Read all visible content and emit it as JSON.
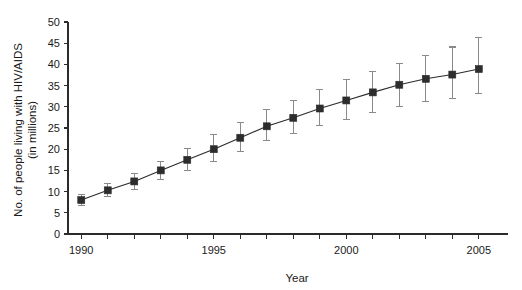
{
  "chart_data": {
    "type": "line",
    "title": "",
    "xlabel": "Year",
    "ylabel_line1": "No. of people living with HIV/AIDS",
    "ylabel_line2": "(in millions)",
    "ylabel": "No. of people living with HIV/AIDS (in millions)",
    "x": [
      1990,
      1991,
      1992,
      1993,
      1994,
      1995,
      1996,
      1997,
      1998,
      1999,
      2000,
      2001,
      2002,
      2003,
      2004,
      2005
    ],
    "values": [
      8.0,
      10.3,
      12.4,
      15.0,
      17.5,
      20.0,
      22.7,
      25.4,
      27.4,
      29.6,
      31.5,
      33.4,
      35.2,
      36.6,
      37.6,
      38.9
    ],
    "error_low": [
      6.8,
      8.8,
      10.6,
      12.9,
      15.0,
      17.1,
      19.5,
      22.1,
      23.8,
      25.6,
      27.1,
      28.7,
      30.1,
      31.2,
      32.0,
      33.1
    ],
    "error_high": [
      9.3,
      11.9,
      14.3,
      17.2,
      20.1,
      23.4,
      26.4,
      29.4,
      31.4,
      34.0,
      36.4,
      38.4,
      40.2,
      42.2,
      44.1,
      46.4
    ],
    "xlim": [
      1989.5,
      2005.8
    ],
    "ylim": [
      0,
      50
    ],
    "xticks": [
      1990,
      1991,
      1992,
      1993,
      1994,
      1995,
      1996,
      1997,
      1998,
      1999,
      2000,
      2001,
      2002,
      2003,
      2004,
      2005
    ],
    "xtick_labels": [
      "1990",
      "",
      "",
      "",
      "",
      "1995",
      "",
      "",
      "",
      "",
      "2000",
      "",
      "",
      "",
      "",
      "2005"
    ],
    "yticks": [
      0,
      5,
      10,
      15,
      20,
      25,
      30,
      35,
      40,
      45,
      50
    ],
    "ytick_labels": [
      "0",
      "5",
      "10",
      "15",
      "20",
      "25",
      "30",
      "35",
      "40",
      "45",
      "50"
    ],
    "grid": false,
    "legend": false,
    "marker": "square",
    "error_bars": true,
    "colors": {
      "line": "#2b2b2b",
      "marker": "#2d2d2d",
      "errorbar": "#8a8a8a",
      "axis": "#2b2b2b",
      "text": "#1a1a1a",
      "background": "#ffffff"
    }
  }
}
